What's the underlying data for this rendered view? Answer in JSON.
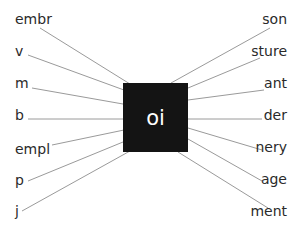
{
  "center": {
    "text": "oi",
    "fill": "#141414",
    "text_color": "#ffffff"
  },
  "line_color": "#9a9a9a",
  "left_items": [
    {
      "label": "embr",
      "y": 18,
      "line": [
        40,
        28,
        130,
        84
      ]
    },
    {
      "label": "v",
      "y": 50,
      "line": [
        28,
        55,
        124,
        90
      ]
    },
    {
      "label": "m",
      "y": 82,
      "line": [
        32,
        88,
        123,
        104
      ]
    },
    {
      "label": "b",
      "y": 114,
      "line": [
        28,
        119,
        123,
        119
      ]
    },
    {
      "label": "empl",
      "y": 146,
      "line": [
        52,
        145,
        124,
        130
      ]
    },
    {
      "label": "p",
      "y": 178,
      "line": [
        28,
        181,
        123,
        142
      ]
    },
    {
      "label": "j",
      "y": 208,
      "line": [
        22,
        211,
        130,
        151
      ]
    }
  ],
  "right_items": [
    {
      "label": "son",
      "y": 18,
      "line": [
        270,
        28,
        171,
        83
      ]
    },
    {
      "label": "sture",
      "y": 50,
      "line": [
        260,
        58,
        188,
        88
      ]
    },
    {
      "label": "ant",
      "y": 82,
      "line": [
        264,
        90,
        188,
        100
      ]
    },
    {
      "label": "der",
      "y": 114,
      "line": [
        262,
        119,
        188,
        119
      ]
    },
    {
      "label": "nery",
      "y": 146,
      "line": [
        262,
        150,
        188,
        128
      ]
    },
    {
      "label": "age",
      "y": 178,
      "line": [
        262,
        181,
        188,
        139
      ]
    },
    {
      "label": "ment",
      "y": 208,
      "line": [
        268,
        208,
        178,
        152
      ]
    }
  ]
}
